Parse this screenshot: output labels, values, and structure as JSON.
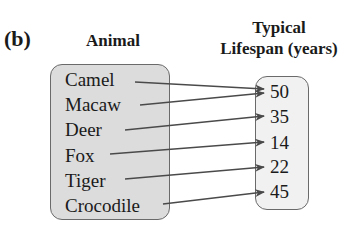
{
  "panel_label": "(b)",
  "headers": {
    "domain": "Animal",
    "range_line1": "Typical",
    "range_line2": "Lifespan (years)"
  },
  "domain_items": [
    "Camel",
    "Macaw",
    "Deer",
    "Fox",
    "Tiger",
    "Crocodile"
  ],
  "range_items": [
    "50",
    "35",
    "14",
    "22",
    "45"
  ],
  "mapping": [
    {
      "from": "Camel",
      "to": "50"
    },
    {
      "from": "Macaw",
      "to": "50"
    },
    {
      "from": "Deer",
      "to": "35"
    },
    {
      "from": "Fox",
      "to": "14"
    },
    {
      "from": "Tiger",
      "to": "22"
    },
    {
      "from": "Crocodile",
      "to": "45"
    }
  ],
  "colors": {
    "domain_fill": "#dcdcdc",
    "range_fill": "#f1f1f1",
    "border": "#6a6a6a",
    "arrow": "#4a4a4a"
  }
}
